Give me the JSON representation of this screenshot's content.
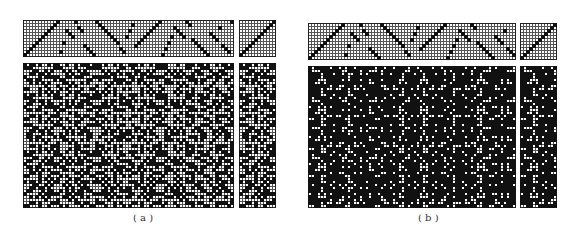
{
  "figure": {
    "panels": [
      {
        "id": "a",
        "label": "( a )",
        "label_pos": [
          133,
          212
        ],
        "mode": "light",
        "tieup": {
          "x": 23,
          "y": 20,
          "cols": 70,
          "rows": 12,
          "cell": 3
        },
        "treadle": {
          "x": 239,
          "y": 20,
          "cols": 12,
          "rows": 12,
          "cell": 3
        },
        "drawdown": {
          "x": 23,
          "y": 63,
          "cols": 70,
          "rows": 48,
          "cell": 3
        },
        "side": {
          "x": 239,
          "y": 63,
          "cols": 12,
          "rows": 48,
          "cell": 3
        },
        "threading": [
          0,
          1,
          2,
          3,
          4,
          5,
          6,
          7,
          8,
          9,
          10,
          11,
          1,
          4,
          8,
          7,
          6,
          11,
          9,
          8,
          3,
          2,
          1,
          0,
          11,
          10,
          9,
          8,
          7,
          6,
          5,
          4,
          2,
          1,
          6,
          8,
          10,
          3,
          4,
          5,
          6,
          7,
          8,
          9,
          10,
          11,
          0,
          2,
          4,
          6,
          9,
          8,
          7,
          6,
          11,
          10,
          5,
          4,
          3,
          2,
          1,
          0,
          7,
          6,
          5,
          9,
          3,
          2,
          1,
          11
        ],
        "density": 0.45
      },
      {
        "id": "b",
        "label": "( b )",
        "label_pos": [
          418,
          212
        ],
        "mode": "dark",
        "tieup": {
          "x": 308,
          "y": 23,
          "cols": 69,
          "rows": 12,
          "cell": 3
        },
        "treadle": {
          "x": 520,
          "y": 23,
          "cols": 12,
          "rows": 12,
          "cell": 3
        },
        "drawdown": {
          "x": 308,
          "y": 66,
          "cols": 69,
          "rows": 47,
          "cell": 3
        },
        "side": {
          "x": 520,
          "y": 66,
          "cols": 12,
          "rows": 47,
          "cell": 3
        },
        "threading": [
          0,
          1,
          2,
          3,
          4,
          5,
          6,
          7,
          8,
          9,
          10,
          11,
          1,
          4,
          8,
          7,
          6,
          11,
          9,
          8,
          3,
          2,
          1,
          0,
          11,
          10,
          9,
          8,
          7,
          6,
          5,
          4,
          2,
          1,
          6,
          8,
          10,
          3,
          4,
          5,
          6,
          7,
          8,
          9,
          10,
          11,
          0,
          2,
          4,
          6,
          9,
          8,
          7,
          6,
          11,
          10,
          5,
          4,
          3,
          2,
          1,
          0,
          7,
          6,
          5,
          9,
          3,
          2,
          1
        ],
        "density": 0.72
      }
    ],
    "colors": {
      "ink": "#111111",
      "grid": "#555555",
      "paper": "#ffffff",
      "border": "#222222"
    }
  }
}
